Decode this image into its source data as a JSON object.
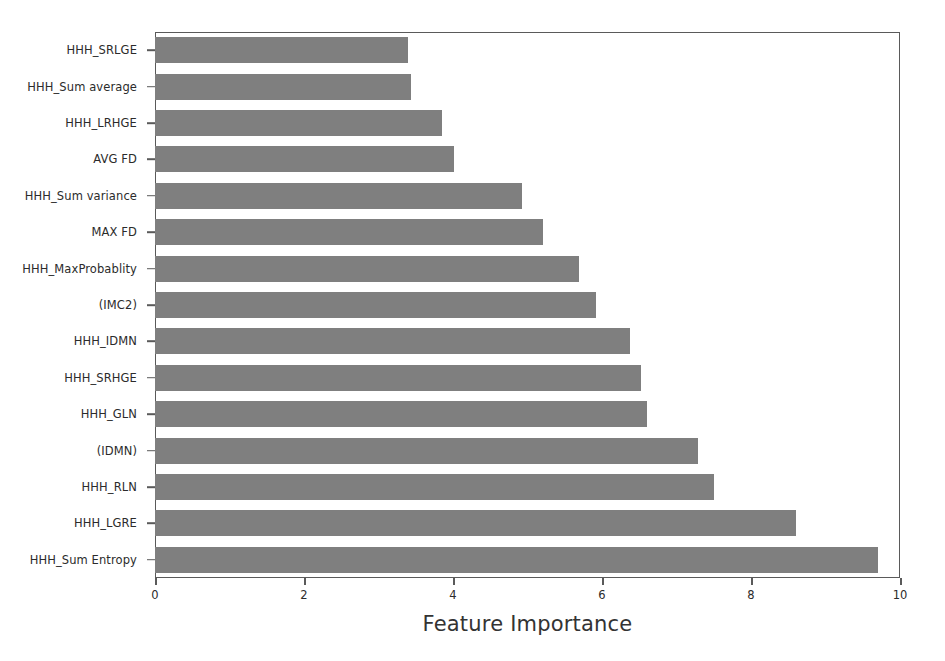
{
  "chart_data": {
    "type": "bar",
    "orientation": "horizontal",
    "title": "",
    "xlabel": "Feature Importance",
    "ylabel": "",
    "xlim": [
      0,
      10
    ],
    "xticks": [
      "0",
      "2",
      "4",
      "6",
      "8",
      "10"
    ],
    "xtick_values": [
      0,
      2,
      4,
      6,
      8,
      10
    ],
    "grid": false,
    "legend": null,
    "bar_color": "#7f7f7f",
    "axis_color": "#5a5a5a",
    "text_color": "#2b2b2b",
    "categories": [
      "HHH_SRLGE",
      "HHH_Sum average",
      "HHH_LRHGE",
      "AVG FD",
      "HHH_Sum variance",
      "MAX FD",
      "HHH_MaxProbablity",
      "(IMC2)",
      "HHH_IDMN",
      "HHH_SRHGE",
      "HHH_GLN",
      "(IDMN)",
      "HHH_RLN",
      "HHH_LGRE",
      "HHH_Sum Entropy"
    ],
    "values": [
      3.39,
      3.44,
      3.85,
      4.01,
      4.92,
      5.21,
      5.69,
      5.92,
      6.38,
      6.52,
      6.61,
      7.29,
      7.51,
      8.61,
      9.7
    ]
  }
}
